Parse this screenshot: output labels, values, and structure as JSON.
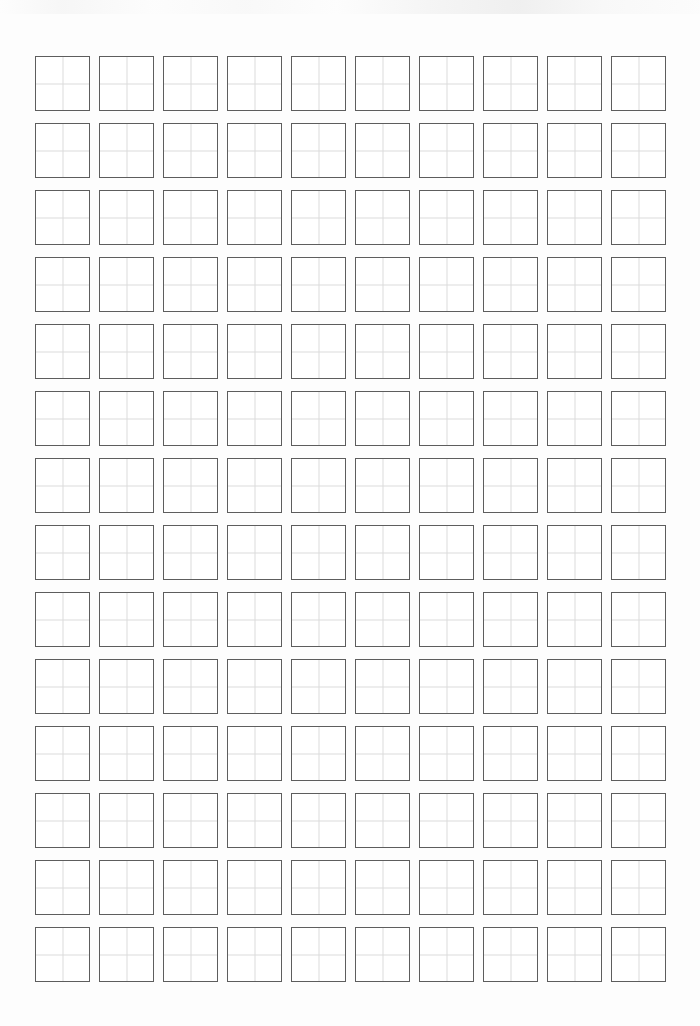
{
  "page": {
    "width": 700,
    "height": 1026,
    "background_color": "#fdfdfd",
    "paper_color": "#ffffff"
  },
  "grid": {
    "name": "tianzige-practice-grid",
    "columns": 10,
    "rows": 14,
    "total_cells": 140,
    "cell_width": 55,
    "cell_height": 55,
    "column_pitch": 64,
    "row_pitch": 67,
    "origin_x": 35,
    "origin_y": 56,
    "border_color": "#5d5d5d",
    "border_width": 1,
    "guide_color": "#dcdcdc",
    "guide_width": 1,
    "guide_style": "cross (vertical + horizontal midlines)",
    "cells_filled": 0,
    "cell_contents": [
      [
        "",
        "",
        "",
        "",
        "",
        "",
        "",
        "",
        "",
        ""
      ],
      [
        "",
        "",
        "",
        "",
        "",
        "",
        "",
        "",
        "",
        ""
      ],
      [
        "",
        "",
        "",
        "",
        "",
        "",
        "",
        "",
        "",
        ""
      ],
      [
        "",
        "",
        "",
        "",
        "",
        "",
        "",
        "",
        "",
        ""
      ],
      [
        "",
        "",
        "",
        "",
        "",
        "",
        "",
        "",
        "",
        ""
      ],
      [
        "",
        "",
        "",
        "",
        "",
        "",
        "",
        "",
        "",
        ""
      ],
      [
        "",
        "",
        "",
        "",
        "",
        "",
        "",
        "",
        "",
        ""
      ],
      [
        "",
        "",
        "",
        "",
        "",
        "",
        "",
        "",
        "",
        ""
      ],
      [
        "",
        "",
        "",
        "",
        "",
        "",
        "",
        "",
        "",
        ""
      ],
      [
        "",
        "",
        "",
        "",
        "",
        "",
        "",
        "",
        "",
        ""
      ],
      [
        "",
        "",
        "",
        "",
        "",
        "",
        "",
        "",
        "",
        ""
      ],
      [
        "",
        "",
        "",
        "",
        "",
        "",
        "",
        "",
        "",
        ""
      ],
      [
        "",
        "",
        "",
        "",
        "",
        "",
        "",
        "",
        "",
        ""
      ],
      [
        "",
        "",
        "",
        "",
        "",
        "",
        "",
        "",
        "",
        ""
      ]
    ]
  },
  "artifact": {
    "name": "scan-smudge-top-edge",
    "description": "faint light-gray scanning artifact band across the top margin"
  }
}
